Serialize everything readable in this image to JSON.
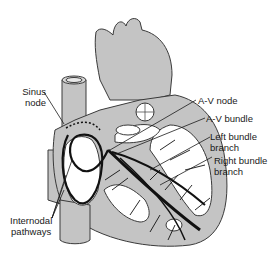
{
  "figure": {
    "colors": {
      "tissue": "#c4c4c4",
      "outline": "#3a3a3a",
      "conduction": "#111111",
      "chamber": "#ffffff"
    }
  },
  "labels": {
    "sinus_node": [
      "Sinus",
      "node"
    ],
    "av_node": "A-V node",
    "av_bundle": "A-V bundle",
    "left_bundle_branch": [
      "Left bundle",
      "branch"
    ],
    "right_bundle_branch": [
      "Right bundle",
      "branch"
    ],
    "internodal_pathways": [
      "Internodal",
      "pathways"
    ]
  }
}
